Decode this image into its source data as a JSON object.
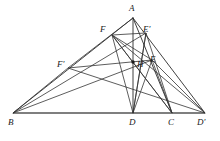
{
  "figure": {
    "width": 220,
    "height": 141,
    "background_color": "#ffffff",
    "line_color": "#2b2b2b",
    "base_line_color": "#555555",
    "label_color": "#1a1a1a",
    "points": [
      {
        "id": "A",
        "label": "A",
        "x": 133,
        "y": 18,
        "label_x": 129,
        "label_y": 4,
        "marker": false
      },
      {
        "id": "B",
        "label": "B",
        "x": 13,
        "y": 113,
        "label_x": 8,
        "label_y": 118,
        "marker": false
      },
      {
        "id": "C",
        "label": "C",
        "x": 172,
        "y": 113,
        "label_x": 168,
        "label_y": 118,
        "marker": false
      },
      {
        "id": "D",
        "label": "D",
        "x": 133,
        "y": 113,
        "label_x": 129,
        "label_y": 118,
        "marker": false
      },
      {
        "id": "E",
        "label": "E",
        "x": 152,
        "y": 60,
        "label_x": 150,
        "label_y": 55,
        "marker": false
      },
      {
        "id": "F",
        "label": "F",
        "x": 112,
        "y": 35,
        "label_x": 100,
        "label_y": 25,
        "marker": false
      },
      {
        "id": "H",
        "label": "H",
        "x": 133,
        "y": 62,
        "label_x": 137,
        "label_y": 60,
        "marker": true
      },
      {
        "id": "Dp",
        "label": "D'",
        "x": 205,
        "y": 113,
        "label_x": 197,
        "label_y": 118,
        "marker": false
      },
      {
        "id": "Ep",
        "label": "E'",
        "x": 146,
        "y": 33,
        "label_x": 143,
        "label_y": 25,
        "marker": false
      },
      {
        "id": "Fp",
        "label": "F'",
        "x": 68,
        "y": 68,
        "label_x": 57,
        "label_y": 60,
        "marker": false
      }
    ],
    "segments": [
      {
        "name": "side-AB",
        "from": "A",
        "to": "B",
        "style": "edge"
      },
      {
        "name": "side-AC",
        "from": "A",
        "to": "C",
        "style": "edge"
      },
      {
        "name": "base-BDp",
        "from": "B",
        "to": "Dp",
        "style": "edge-base"
      },
      {
        "name": "altitude-AD",
        "from": "A",
        "to": "D",
        "style": "edge"
      },
      {
        "name": "altitude-BE",
        "from": "B",
        "to": "E",
        "style": "edge-thin"
      },
      {
        "name": "altitude-CF",
        "from": "C",
        "to": "F",
        "style": "edge-thin"
      },
      {
        "name": "cevian-A-Dp",
        "from": "A",
        "to": "Dp",
        "style": "edge"
      },
      {
        "name": "cevian-B-Ep",
        "from": "B",
        "to": "Ep",
        "style": "edge-thin"
      },
      {
        "name": "cevian-Fp-Dp",
        "from": "Fp",
        "to": "Dp",
        "style": "edge-thin"
      },
      {
        "name": "seg-B-Fp",
        "from": "B",
        "to": "Fp",
        "style": "edge-thin"
      },
      {
        "name": "seg-Fp-A",
        "from": "Fp",
        "to": "A",
        "style": "edge-thin"
      },
      {
        "name": "seg-Fp-E",
        "from": "Fp",
        "to": "E",
        "style": "edge-thin"
      },
      {
        "name": "seg-F-D",
        "from": "F",
        "to": "D",
        "style": "edge-thin"
      },
      {
        "name": "seg-F-E",
        "from": "F",
        "to": "E",
        "style": "edge-thin"
      },
      {
        "name": "seg-F-Ep",
        "from": "F",
        "to": "Ep",
        "style": "edge-thin"
      },
      {
        "name": "seg-F-C",
        "from": "F",
        "to": "C",
        "style": "edge-thin"
      },
      {
        "name": "seg-F-Dp",
        "from": "F",
        "to": "Dp",
        "style": "edge-thin"
      },
      {
        "name": "seg-Ep-D",
        "from": "Ep",
        "to": "D",
        "style": "edge-thin"
      },
      {
        "name": "seg-Ep-C",
        "from": "Ep",
        "to": "C",
        "style": "edge-thin"
      },
      {
        "name": "seg-E-D",
        "from": "E",
        "to": "D",
        "style": "edge-thin"
      },
      {
        "name": "seg-E-C",
        "from": "E",
        "to": "C",
        "style": "edge-thin"
      },
      {
        "name": "seg-E-Dp",
        "from": "E",
        "to": "Dp",
        "style": "edge-thin"
      },
      {
        "name": "seg-D-Ep2",
        "from": "D",
        "to": "Ep",
        "style": "edge-thin"
      }
    ]
  }
}
